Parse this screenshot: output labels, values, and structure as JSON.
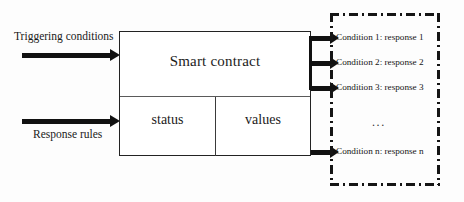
{
  "diagram": {
    "contract": {
      "title": "Smart contract",
      "cells": [
        {
          "name": "status",
          "label": "status"
        },
        {
          "name": "values",
          "label": "values"
        }
      ]
    },
    "inputs": [
      {
        "name": "triggering-conditions",
        "label": "Triggering conditions",
        "arrow": "right-arrow"
      },
      {
        "name": "response-rules",
        "label": "Response rules",
        "arrow": "right-arrow"
      }
    ],
    "outputs": [
      {
        "name": "condition-1",
        "label": "Condition 1: response 1",
        "top": 32
      },
      {
        "name": "condition-2",
        "label": "Condition 2: response 2",
        "top": 57
      },
      {
        "name": "condition-3",
        "label": "Condition 3: response 3",
        "top": 82
      },
      {
        "name": "condition-n",
        "label": "Condition n: response n",
        "top": 146
      }
    ],
    "ellipsis": "...",
    "colors": {
      "stroke": "#151515",
      "box_border": "#222222",
      "divider": "#5a5a5a",
      "background": "#fdfdfd"
    }
  }
}
